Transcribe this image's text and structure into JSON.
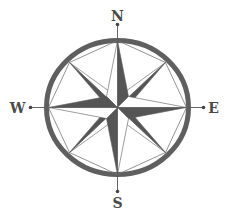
{
  "figure": {
    "colors": {
      "background": "#ffffff",
      "ring": "#5f5f5f",
      "dark_fill": "#555555",
      "light_fill": "#ffffff",
      "outline": "#5a5a5a",
      "label": "#4a4a4a"
    },
    "labels": {
      "north": "N",
      "east": "E",
      "south": "S",
      "west": "W"
    },
    "points": {
      "cardinal": [
        "N",
        "E",
        "S",
        "W"
      ],
      "intercardinal": [
        "NE",
        "SE",
        "SW",
        "NW"
      ]
    }
  }
}
